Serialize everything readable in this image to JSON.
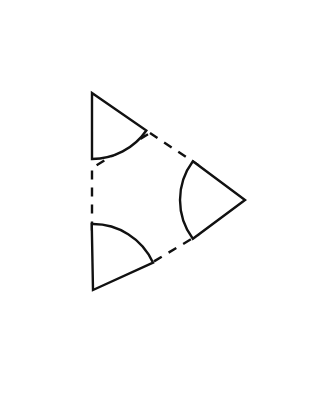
{
  "figure": {
    "canvas": {
      "width": 336,
      "height": 395,
      "background_color": "#ffffff"
    },
    "style": {
      "stroke_color": "#111111",
      "fill_color": "#ffffff",
      "solid_stroke_width": 2.4,
      "dashed_stroke_width": 2.4,
      "dash_pattern": "9 8"
    },
    "shapes": {
      "circles": [
        {
          "name": "top-left-pacman",
          "label": "Top-left notched circle",
          "center_x": 92,
          "center_y": 93,
          "radius": 66,
          "wedge_start_x": 150,
          "wedge_start_y": 133,
          "wedge_end_x": 92,
          "wedge_end_y": 168,
          "wedge_opens_toward": "lower-right"
        },
        {
          "name": "right-pacman",
          "label": "Right notched circle",
          "center_x": 245,
          "center_y": 200,
          "radius": 65,
          "wedge_start_x": 198,
          "wedge_start_y": 235,
          "wedge_end_x": 198,
          "wedge_end_y": 165,
          "wedge_opens_toward": "left"
        },
        {
          "name": "bottom-left-pacman",
          "label": "Bottom-left notched circle",
          "center_x": 93,
          "center_y": 290,
          "radius": 66,
          "wedge_start_x": 92,
          "wedge_start_y": 237,
          "wedge_end_x": 148,
          "wedge_end_y": 265,
          "wedge_opens_toward": "upper-right"
        }
      ],
      "hexagon": {
        "name": "central-dashed-hexagon",
        "label": "Illusory central hexagon",
        "points": "150,133 198,165 198,235 148,265 92,237 92,168",
        "vertex_count": 6
      }
    }
  }
}
